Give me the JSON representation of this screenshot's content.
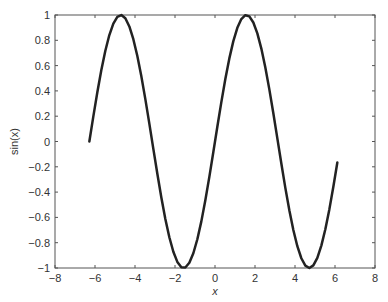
{
  "chart_data": {
    "type": "line",
    "title": "",
    "xlabel": "x",
    "ylabel": "sin(x)",
    "xlim": [
      -8,
      8
    ],
    "ylim": [
      -1,
      1
    ],
    "grid": false,
    "legend": null,
    "xticks": [
      -8,
      -6,
      -4,
      -2,
      0,
      2,
      4,
      6,
      8
    ],
    "xtick_labels": [
      "−8",
      "−6",
      "−4",
      "−2",
      "0",
      "2",
      "4",
      "6",
      "8"
    ],
    "yticks": [
      -1,
      -0.8,
      -0.6,
      -0.4,
      -0.2,
      0,
      0.2,
      0.4,
      0.6,
      0.8,
      1
    ],
    "ytick_labels": [
      "−1",
      "−0.8",
      "−0.6",
      "−0.4",
      "−0.2",
      "0",
      "0.2",
      "0.4",
      "0.6",
      "0.8",
      "1"
    ],
    "series": [
      {
        "name": "sin(x)",
        "function": "sin",
        "x_start": -6.2832,
        "x_step": 0.2,
        "x_end": 6.1168,
        "color": "#222222",
        "line_width": 2.5
      }
    ]
  },
  "plot_area": {
    "left": 55,
    "top": 15,
    "right": 375,
    "bottom": 268
  },
  "colors": {
    "axis": "#555555",
    "line": "#222222",
    "text": "#333333"
  }
}
